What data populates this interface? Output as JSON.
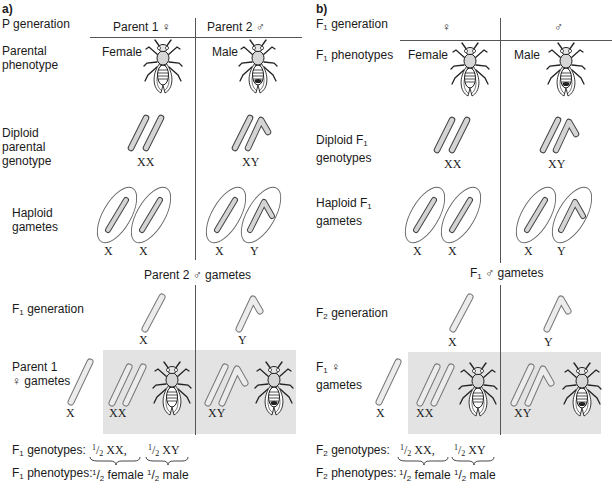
{
  "panels": [
    {
      "id": "a",
      "letter": "a)",
      "gen_label": "P generation",
      "col_female": "Parent 1 ♀",
      "col_male": "Parent 2 ♂",
      "row_phenotype": [
        "Parental",
        "phenotype"
      ],
      "female_label": "Female",
      "male_label": "Male",
      "row_diploid": [
        "Diploid",
        "parental",
        "genotype"
      ],
      "diploid_female_genotype": "XX",
      "diploid_male_genotype": "XY",
      "row_haploid": [
        "Haploid",
        "gametes"
      ],
      "gametes_female": [
        "X",
        "X"
      ],
      "gametes_male": [
        "X",
        "Y"
      ],
      "cross_male_header": "Parent 2 ♂ gametes",
      "offspring_gen": "F",
      "offspring_gen_sub": "1",
      "offspring_gen_suffix": " generation",
      "cross_female_row": [
        "Parent 1",
        "♀ gametes"
      ],
      "male_gamete_x": "X",
      "male_gamete_y": "Y",
      "female_gamete": "X",
      "offspring_xx": "XX",
      "offspring_xy": "XY",
      "summary_genotypes_prefix": "F",
      "summary_sub": "1",
      "summary_genotypes_label": " genotypes:",
      "summary_phenotypes_label": " phenotypes:",
      "frac_num": "1",
      "frac_den": "2",
      "genotype_xx": " XX,",
      "genotype_xy": " XY",
      "phenotype_female": " female",
      "phenotype_male": " male"
    },
    {
      "id": "b",
      "letter": "b)",
      "gen_label_prefix": "F",
      "gen_label_sub": "1",
      "gen_label_suffix": " generation",
      "col_female": "♀",
      "col_male": "♂",
      "row_phenotype_prefix": "F",
      "row_phenotype_sub": "1",
      "row_phenotype_suffix": " phenotypes",
      "female_label": "Female",
      "male_label": "Male",
      "row_diploid_l1_prefix": "Diploid F",
      "row_diploid_sub": "1",
      "row_diploid_l2": "genotypes",
      "diploid_female_genotype": "XX",
      "diploid_male_genotype": "XY",
      "row_haploid_l1_prefix": "Haploid F",
      "row_haploid_sub": "1",
      "row_haploid_l2": "gametes",
      "gametes_female": [
        "X",
        "X"
      ],
      "gametes_male": [
        "X",
        "Y"
      ],
      "cross_male_header_prefix": "F",
      "cross_male_header_sub": "1",
      "cross_male_header_suffix": " ♂ gametes",
      "offspring_gen": "F",
      "offspring_gen_sub": "2",
      "offspring_gen_suffix": " generation",
      "cross_female_row_prefix": "F",
      "cross_female_row_sub": "1",
      "cross_female_row_suffix": " ♀",
      "cross_female_row_l2": "gametes",
      "male_gamete_x": "X",
      "male_gamete_y": "Y",
      "female_gamete": "X",
      "offspring_xx": "XX",
      "offspring_xy": "XY",
      "summary_genotypes_prefix": "F",
      "summary_sub": "2",
      "summary_genotypes_label": " genotypes:",
      "summary_phenotypes_label": " phenotypes:",
      "frac_num": "1",
      "frac_den": "2",
      "genotype_xx": " XX,",
      "genotype_xy": " XY",
      "phenotype_female": " female",
      "phenotype_male": " male"
    }
  ],
  "colors": {
    "chromosome_fill": "#d4d4d4",
    "chromosome_stroke": "#444444",
    "shade": "#e3e3e3",
    "rule": "#555555"
  }
}
